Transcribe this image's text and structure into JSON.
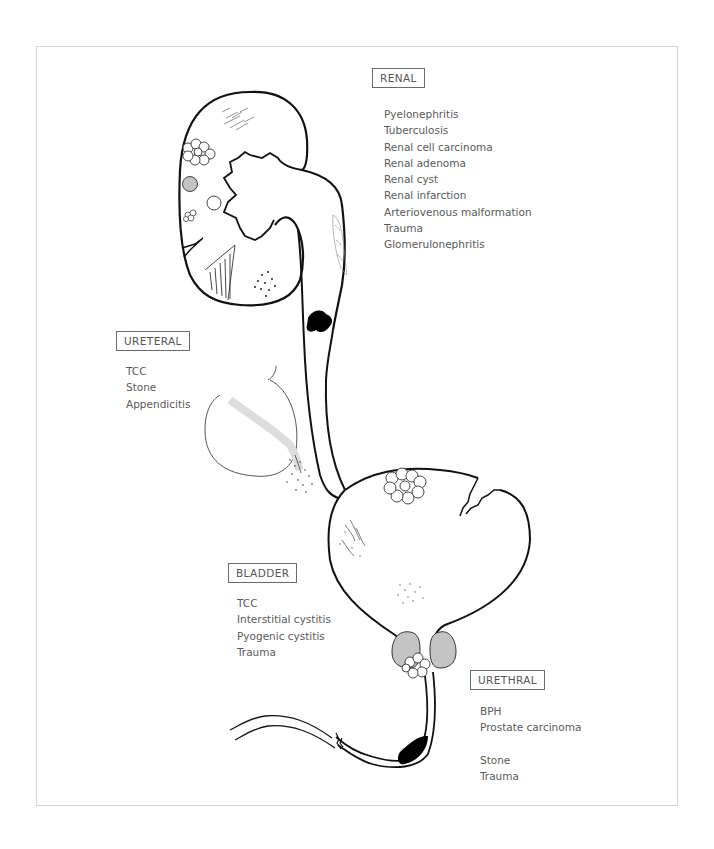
{
  "diagram": {
    "type": "medical-illustration"
  },
  "groups": {
    "renal": {
      "label": "RENAL",
      "items": [
        "Pyelonephritis",
        "Tuberculosis",
        "Renal cell carcinoma",
        "Renal adenoma",
        "Renal cyst",
        "Renal infarction",
        "Arteriovenous malformation",
        "Trauma",
        "Glomerulonephritis"
      ]
    },
    "ureteral": {
      "label": "URETERAL",
      "items": [
        "TCC",
        "Stone",
        "Appendicitis"
      ]
    },
    "bladder": {
      "label": "BLADDER",
      "items": [
        "TCC",
        "Interstitial cystitis",
        "Pyogenic cystitis",
        "Trauma"
      ]
    },
    "urethral": {
      "label": "URETHRAL",
      "items_a": [
        "BPH",
        "Prostate carcinoma"
      ],
      "items_b": [
        "Stone",
        "Trauma"
      ]
    }
  },
  "colors": {
    "line": "#111111",
    "text": "#555555",
    "box_border": "#6a6a6a",
    "frame": "#d4d4d4",
    "gray_fill": "#c4c4c4"
  }
}
